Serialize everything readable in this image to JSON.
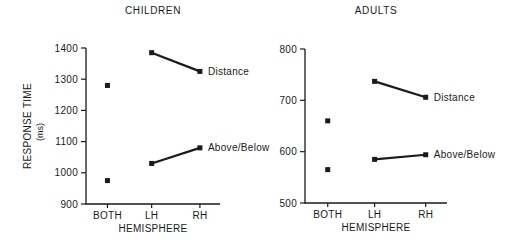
{
  "figure": {
    "background": "#ffffff",
    "ink_color": "#1a1a1a"
  },
  "chart_data": [
    {
      "type": "line",
      "title": "CHILDREN",
      "xlabel": "HEMISPHERE",
      "ylabel": "RESPONSE TIME",
      "ylabel_unit": "(ms)",
      "categories": [
        "BOTH",
        "LH",
        "RH"
      ],
      "ylim": [
        900,
        1400
      ],
      "yticks": [
        900,
        1000,
        1100,
        1200,
        1300,
        1400
      ],
      "grid": false,
      "marker": "filled-square",
      "legend_position": "inline-right-of-last-point",
      "series": [
        {
          "name": "Distance",
          "values": [
            1280,
            1385,
            1325
          ],
          "line_connects": [
            "LH",
            "RH"
          ]
        },
        {
          "name": "Above/Below",
          "values": [
            975,
            1030,
            1080
          ],
          "line_connects": [
            "LH",
            "RH"
          ]
        }
      ]
    },
    {
      "type": "line",
      "title": "ADULTS",
      "xlabel": "HEMISPHERE",
      "ylabel": "",
      "ylabel_unit": "",
      "categories": [
        "BOTH",
        "LH",
        "RH"
      ],
      "ylim": [
        500,
        800
      ],
      "yticks": [
        500,
        600,
        700,
        800
      ],
      "grid": false,
      "marker": "filled-square",
      "legend_position": "inline-right-of-last-point",
      "series": [
        {
          "name": "Distance",
          "values": [
            660,
            737,
            706
          ],
          "line_connects": [
            "LH",
            "RH"
          ]
        },
        {
          "name": "Above/Below",
          "values": [
            565,
            585,
            594
          ],
          "line_connects": [
            "LH",
            "RH"
          ]
        }
      ]
    }
  ]
}
